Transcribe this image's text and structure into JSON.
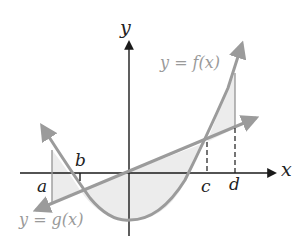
{
  "figure": {
    "axes": {
      "x_label": "x",
      "y_label": "y"
    },
    "functions": [
      {
        "id": "f",
        "label": "y = f(x)",
        "type": "parabola (upward-opening)"
      },
      {
        "id": "g",
        "label": "y = g(x)",
        "type": "line (positive slope through origin)"
      }
    ],
    "points": [
      {
        "name": "a",
        "label": "a",
        "marker": "solid vertical segment"
      },
      {
        "name": "b",
        "label": "b",
        "marker": "tick at intersection of f and g"
      },
      {
        "name": "c",
        "label": "c",
        "marker": "dashed segment at intersection of f and g"
      },
      {
        "name": "d",
        "label": "d",
        "marker": "solid segment from f to g, dashed to axis"
      }
    ],
    "shaded_regions": [
      "between f and g from a to b",
      "between g and f from b to c",
      "between f and g from c to d"
    ],
    "colors": {
      "axes": "#1a1a1a",
      "curves": "#9b9b9b",
      "shading": "#ececec",
      "function_labels": "#9a9a9a"
    }
  }
}
